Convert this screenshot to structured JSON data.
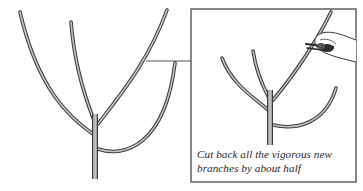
{
  "figure": {
    "caption": {
      "line1": "Cut back all the vigorous new",
      "line2": "branches by about half"
    },
    "colors": {
      "background": "#ffffff",
      "line": "#3a3a3a",
      "branch_fill": "#b9b9b9",
      "box_border": "#555555"
    },
    "panels": [
      {
        "name": "before",
        "label": ""
      },
      {
        "name": "after-inset",
        "label": ""
      }
    ]
  }
}
